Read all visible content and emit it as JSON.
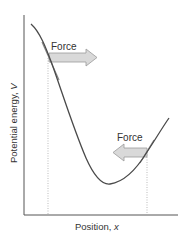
{
  "diagram": {
    "title": "",
    "y_axis_label": "Potential energy, V",
    "x_axis_label": "Position, x",
    "y_axis_label_text": "Potential energy, ",
    "y_axis_label_var": "V",
    "x_axis_label_text": "Position, ",
    "x_axis_label_var": "x",
    "arrows": [
      {
        "label": "Force",
        "direction": "right",
        "location": "left steep slope"
      },
      {
        "label": "Force",
        "direction": "left",
        "location": "right rising slope"
      }
    ],
    "curve": "potential energy well with minimum near right-center",
    "colors": {
      "curve": "#4a4a4a",
      "axis": "#555555",
      "arrow_fill": "#d9d9d9",
      "arrow_stroke": "#9a9a9a",
      "dotted": "#aaaaaa",
      "text": "#333333"
    }
  }
}
